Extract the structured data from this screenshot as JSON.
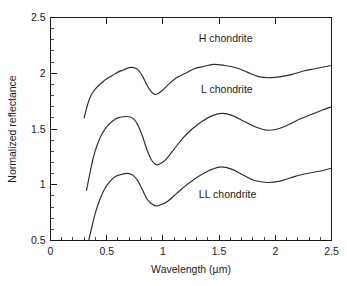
{
  "chart_data": {
    "type": "line",
    "title": "",
    "xlabel": "Wavelength (µm)",
    "ylabel": "Normalized reflectance",
    "xlim": [
      0,
      2.5
    ],
    "ylim": [
      0.5,
      2.5
    ],
    "grid": false,
    "legend_position": "inline-annotations",
    "xticks": [
      0,
      0.5,
      1,
      1.5,
      2,
      2.5
    ],
    "xtick_labels": [
      "0",
      "0.5",
      "1",
      "1.5",
      "2",
      "2.5"
    ],
    "yticks": [
      0.5,
      1,
      1.5,
      2,
      2.5
    ],
    "ytick_labels": [
      "0.5",
      "1",
      "1.5",
      "2",
      "2.5"
    ],
    "x_minor_tick_step": 0.1,
    "y_minor_tick_step": 0.1,
    "series": [
      {
        "name": "H chondrite",
        "label_x": 1.32,
        "label_y": 2.28,
        "x": [
          0.3,
          0.33,
          0.36,
          0.4,
          0.45,
          0.5,
          0.55,
          0.6,
          0.65,
          0.7,
          0.74,
          0.78,
          0.82,
          0.86,
          0.9,
          0.93,
          0.96,
          1.0,
          1.05,
          1.12,
          1.2,
          1.28,
          1.36,
          1.45,
          1.55,
          1.65,
          1.75,
          1.85,
          1.95,
          2.05,
          2.15,
          2.25,
          2.35,
          2.5
        ],
        "y": [
          1.6,
          1.72,
          1.8,
          1.86,
          1.91,
          1.95,
          1.98,
          2.01,
          2.03,
          2.05,
          2.05,
          2.03,
          1.97,
          1.89,
          1.83,
          1.81,
          1.82,
          1.85,
          1.9,
          1.96,
          2.0,
          2.04,
          2.06,
          2.08,
          2.07,
          2.05,
          2.01,
          1.97,
          1.96,
          1.97,
          1.99,
          2.02,
          2.04,
          2.07
        ]
      },
      {
        "name": "L chondrite",
        "label_x": 1.34,
        "label_y": 1.82,
        "x": [
          0.32,
          0.35,
          0.38,
          0.42,
          0.46,
          0.5,
          0.55,
          0.6,
          0.65,
          0.7,
          0.74,
          0.78,
          0.82,
          0.86,
          0.9,
          0.94,
          0.98,
          1.03,
          1.1,
          1.18,
          1.26,
          1.35,
          1.44,
          1.53,
          1.62,
          1.72,
          1.82,
          1.92,
          2.02,
          2.12,
          2.22,
          2.32,
          2.42,
          2.5
        ],
        "y": [
          0.95,
          1.1,
          1.24,
          1.37,
          1.46,
          1.52,
          1.57,
          1.6,
          1.61,
          1.61,
          1.59,
          1.53,
          1.43,
          1.31,
          1.22,
          1.18,
          1.19,
          1.23,
          1.32,
          1.42,
          1.5,
          1.57,
          1.62,
          1.64,
          1.62,
          1.57,
          1.52,
          1.49,
          1.5,
          1.54,
          1.59,
          1.63,
          1.67,
          1.7
        ]
      },
      {
        "name": "LL chondrite",
        "label_x": 1.32,
        "label_y": 0.88,
        "x": [
          0.34,
          0.37,
          0.4,
          0.44,
          0.48,
          0.52,
          0.57,
          0.62,
          0.66,
          0.7,
          0.74,
          0.78,
          0.82,
          0.86,
          0.9,
          0.94,
          0.98,
          1.04,
          1.12,
          1.2,
          1.28,
          1.36,
          1.44,
          1.52,
          1.61,
          1.71,
          1.81,
          1.93,
          2.03,
          2.13,
          2.23,
          2.33,
          2.43,
          2.5
        ],
        "y": [
          0.5,
          0.63,
          0.75,
          0.87,
          0.96,
          1.02,
          1.07,
          1.09,
          1.1,
          1.1,
          1.08,
          1.03,
          0.95,
          0.87,
          0.83,
          0.81,
          0.82,
          0.85,
          0.92,
          0.99,
          1.05,
          1.1,
          1.14,
          1.16,
          1.14,
          1.09,
          1.04,
          1.02,
          1.03,
          1.06,
          1.09,
          1.11,
          1.13,
          1.15
        ]
      }
    ]
  },
  "axes": {
    "x_title": "Wavelength (µm)",
    "y_title": "Normalized reflectance"
  }
}
